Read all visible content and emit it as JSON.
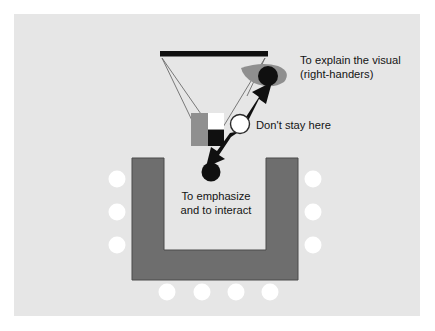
{
  "figure": {
    "background_color": "#ffffff",
    "panel_color": "#e6e6e6",
    "table_color": "#6e6e6e",
    "seat_color": "#ffffff",
    "accent_black": "#101010",
    "accent_gray": "#8f8f8f"
  },
  "labels": {
    "explain_line1": "To explain the visual",
    "explain_line2": "(right-handers)",
    "dont_stay": "Don't stay here",
    "emphasize_line1": "To emphasize",
    "emphasize_line2": "and to interact"
  },
  "elements": {
    "projection_screen": "projection-screen-bar",
    "slide_frame": "projected-slide",
    "slide_white_block": "slide-white-square",
    "slide_black_block": "slide-black-square",
    "presenter_pointing": "presenter-at-screen",
    "presenter_neutral": "presenter-neutral-position",
    "presenter_engaged": "presenter-in-u-opening",
    "table": "u-shaped-table",
    "double_arrow": "movement-arrow"
  },
  "seats": {
    "left_count": 3,
    "right_count": 3,
    "bottom_count": 4,
    "total": 10
  }
}
